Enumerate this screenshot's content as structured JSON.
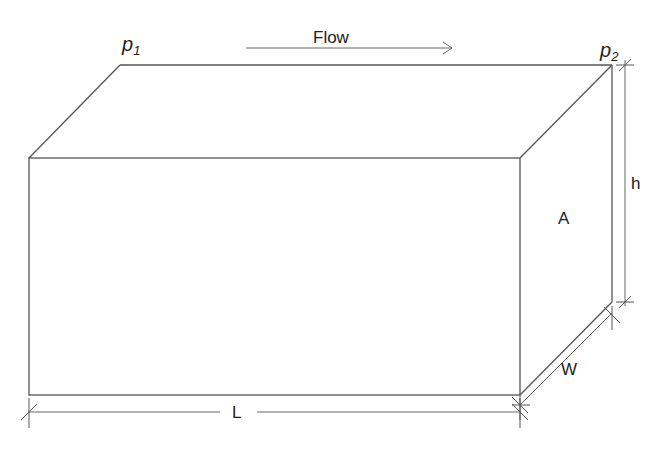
{
  "diagram": {
    "type": "rectangular-channel-flow",
    "labels": {
      "p1": "p",
      "p1_sub": "1",
      "p2": "p",
      "p2_sub": "2",
      "flow": "Flow",
      "height": "h",
      "area": "A",
      "width": "W",
      "length": "L"
    },
    "colors": {
      "line": "#555555",
      "text": "#222222",
      "background": "#ffffff"
    }
  }
}
